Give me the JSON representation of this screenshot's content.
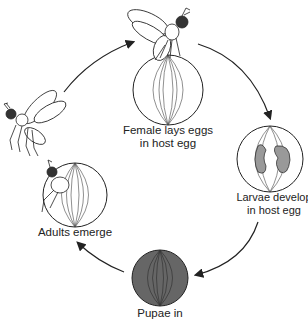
{
  "stages": [
    {
      "id": "lay",
      "label_line1": "Female lays eggs",
      "label_line2": "in host egg"
    },
    {
      "id": "larvae",
      "label_line1": "Larvae develop",
      "label_line2": "in host egg"
    },
    {
      "id": "pupae",
      "label_line1": "Pupae in",
      "label_line2": ""
    },
    {
      "id": "emerge",
      "label_line1": "Adults emerge",
      "label_line2": ""
    }
  ],
  "colors": {
    "line": "#222222",
    "egg_fill": "#ffffff",
    "pupa_fill": "#666666",
    "larva_fill": "#999999"
  }
}
